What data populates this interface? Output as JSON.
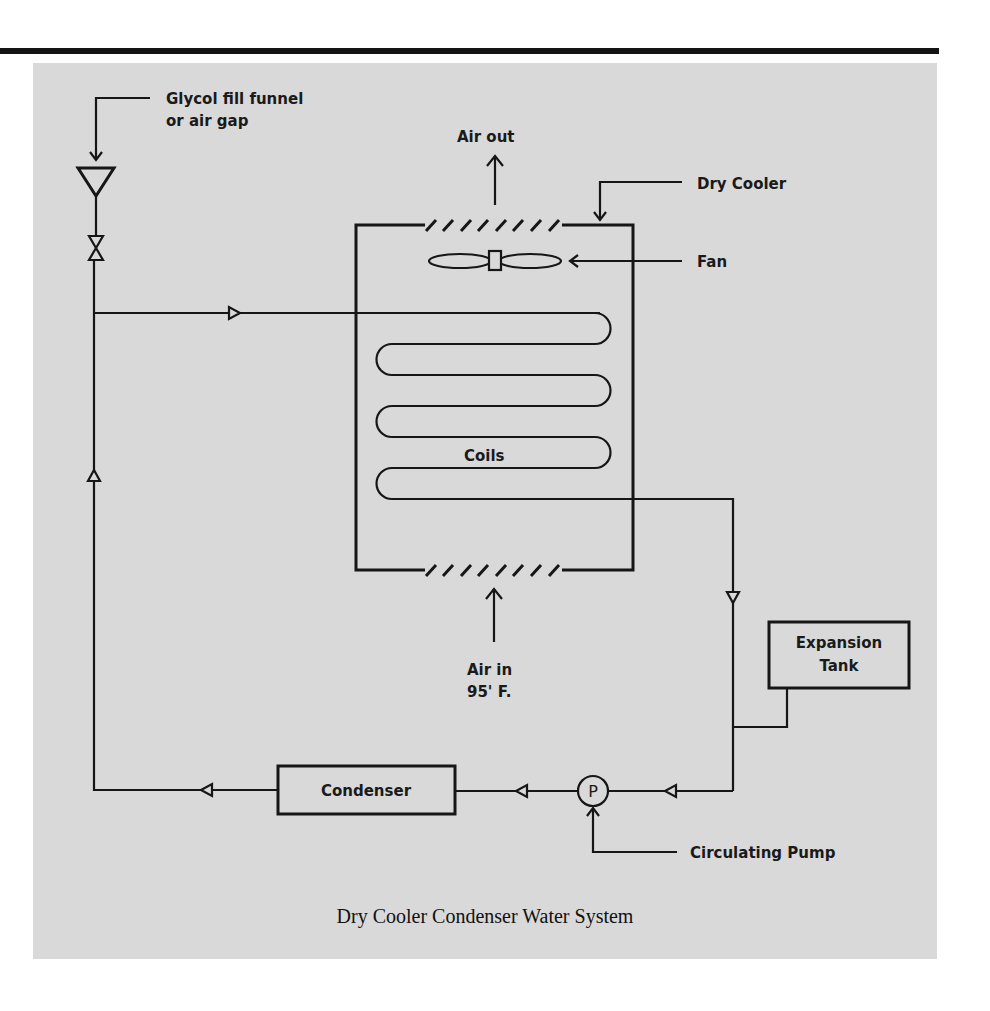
{
  "figure": {
    "caption": "Dry Cooler Condenser Water System",
    "background_color": "#d9d9d9",
    "line_color": "#161616"
  },
  "labels": {
    "glycol_line1": "Glycol fill funnel",
    "glycol_line2": "or air gap",
    "air_out": "Air out",
    "dry_cooler": "Dry Cooler",
    "fan": "Fan",
    "coils": "Coils",
    "air_in_line1": "Air in",
    "air_in_line2": "95' F.",
    "expansion_line1": "Expansion",
    "expansion_line2": "Tank",
    "condenser": "Condenser",
    "pump_symbol": "P",
    "circulating_pump": "Circulating Pump"
  },
  "components": [
    {
      "name": "glycol-fill-funnel",
      "icon": "funnel-triangle-icon"
    },
    {
      "name": "shutoff-valve",
      "icon": "valve-bowtie-icon"
    },
    {
      "name": "dry-cooler",
      "icon": "box"
    },
    {
      "name": "fan",
      "icon": "fan-icon"
    },
    {
      "name": "coils",
      "icon": "serpentine-coil"
    },
    {
      "name": "expansion-tank",
      "icon": "box"
    },
    {
      "name": "circulating-pump",
      "icon": "pump-circle-icon"
    },
    {
      "name": "condenser",
      "icon": "box"
    }
  ]
}
